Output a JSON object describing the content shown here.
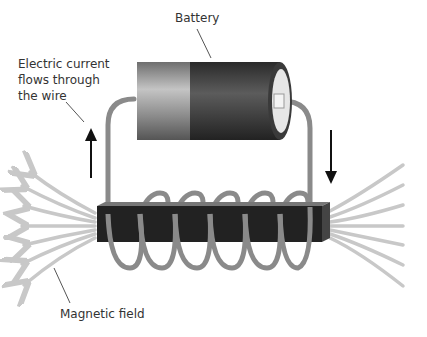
{
  "labels": {
    "battery": "Battery",
    "current": "Electric current\nflows through\nthe wire",
    "field": "Magnetic field"
  },
  "colors": {
    "wire": "#8a8a8a",
    "core": "#222222",
    "field": "#c8c8c8",
    "battery_body": "#9a9a9a",
    "battery_cap": "#444444",
    "arrow": "#111111"
  }
}
